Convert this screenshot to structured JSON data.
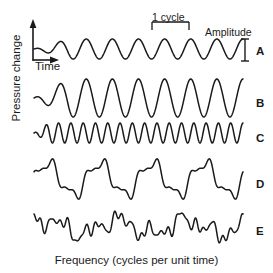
{
  "figure": {
    "title": "",
    "axes": {
      "y_label": "Pressure change",
      "x_label_inline": "Time",
      "x_caption": "Frequency (cycles per unit time)"
    },
    "annotations": {
      "cycle": "1 cycle",
      "amplitude": "Amplitude"
    },
    "trace_labels": {
      "a": "A",
      "b": "B",
      "c": "C",
      "d": "D",
      "e": "E"
    },
    "colors": {
      "stroke": "#1a1a1a",
      "background": "#ffffff",
      "text": "#1a1a1a"
    }
  },
  "chart_data": {
    "type": "line",
    "title": "",
    "xlabel": "Frequency (cycles per unit time)",
    "ylabel": "Pressure change",
    "grid": false,
    "legend": "right-inline",
    "annotations": [
      {
        "text": "1 cycle",
        "kind": "bracket",
        "x_start": 150,
        "x_end": 188,
        "trace": "A"
      },
      {
        "text": "Amplitude",
        "kind": "double-arrow",
        "trace": "A"
      },
      {
        "text": "Time",
        "kind": "axis-arrow"
      }
    ],
    "series": [
      {
        "name": "A",
        "label": "A",
        "description": "low-frequency, low-amplitude pure sine wave",
        "cycles": 8,
        "amplitude": 10,
        "waveform": "sine",
        "baseline_y": 49,
        "x_start": 34,
        "x_end": 243
      },
      {
        "name": "B",
        "label": "B",
        "description": "same frequency as A, larger amplitude pure sine wave",
        "cycles": 8,
        "amplitude": 19,
        "waveform": "sine",
        "baseline_y": 98,
        "x_start": 34,
        "x_end": 243
      },
      {
        "name": "C",
        "label": "C",
        "description": "high-frequency, low-amplitude pure sine wave",
        "cycles": 17,
        "amplitude": 10,
        "waveform": "sine",
        "baseline_y": 133,
        "x_start": 34,
        "x_end": 243
      },
      {
        "name": "D",
        "label": "D",
        "description": "complex periodic wave, fundamental plus harmonics",
        "cycles": 4,
        "amplitude": 24,
        "waveform": "complex-periodic",
        "harmonics": [
          {
            "cycles": 4,
            "amp": 1.0,
            "phase": 0.0
          },
          {
            "cycles": 12,
            "amp": 0.38,
            "phase": 1.1
          },
          {
            "cycles": 20,
            "amp": 0.16,
            "phase": 2.3
          }
        ],
        "baseline_y": 179,
        "x_start": 34,
        "x_end": 243
      },
      {
        "name": "E",
        "label": "E",
        "description": "complex aperiodic noise-like wave",
        "cycles": 4,
        "amplitude": 22,
        "waveform": "complex-noise",
        "harmonics": [
          {
            "cycles": 3,
            "amp": 0.62,
            "phase": 0.4
          },
          {
            "cycles": 7,
            "amp": 0.46,
            "phase": 2.0
          },
          {
            "cycles": 13,
            "amp": 0.4,
            "phase": 0.9
          },
          {
            "cycles": 23,
            "amp": 0.3,
            "phase": 3.1
          },
          {
            "cycles": 31,
            "amp": 0.18,
            "phase": 1.7
          }
        ],
        "baseline_y": 227,
        "x_start": 34,
        "x_end": 243
      }
    ]
  }
}
